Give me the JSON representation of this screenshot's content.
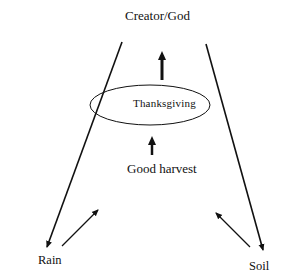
{
  "diagram": {
    "nodes": {
      "creator": {
        "label": "Creator/God"
      },
      "thanksgiving": {
        "label": "Thanksgiving"
      },
      "harvest": {
        "label": "Good harvest"
      },
      "rain": {
        "label": "Rain"
      },
      "soil": {
        "label": "Soil"
      }
    },
    "edges": [
      {
        "from": "harvest",
        "to": "thanksgiving",
        "style": "thick-arrow"
      },
      {
        "from": "thanksgiving",
        "to": "creator",
        "style": "thick-arrow"
      },
      {
        "from": "creator",
        "to": "rain",
        "style": "long-line-arrow"
      },
      {
        "from": "creator",
        "to": "soil",
        "style": "long-line-arrow"
      },
      {
        "from": "rain",
        "to": "harvest",
        "style": "thin-arrow"
      },
      {
        "from": "soil",
        "to": "harvest",
        "style": "thin-arrow"
      }
    ],
    "colors": {
      "ink": "#111111",
      "background": "#ffffff"
    }
  }
}
